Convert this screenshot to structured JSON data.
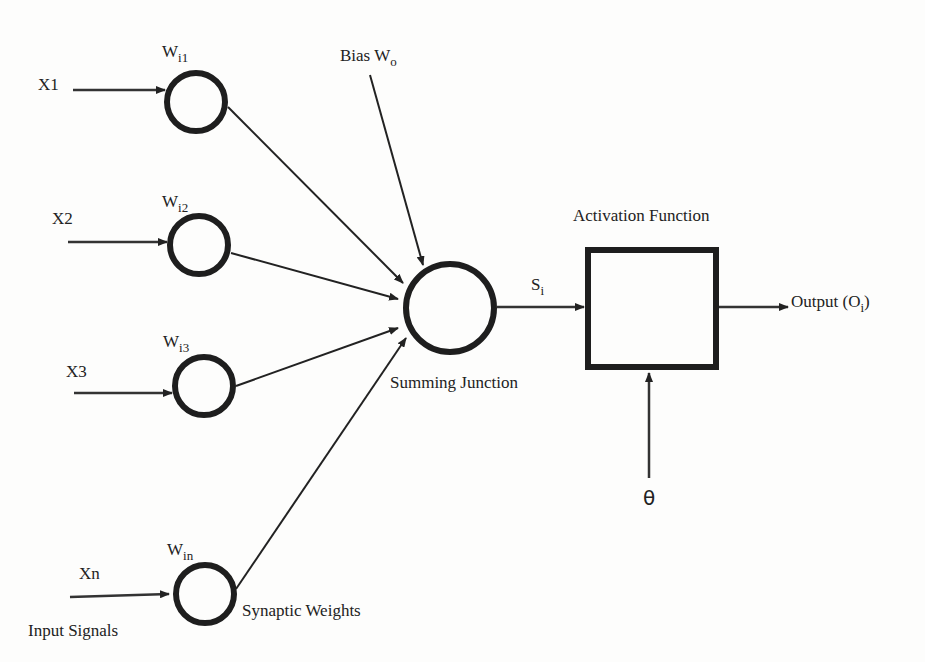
{
  "diagram": {
    "type": "artificial-neuron-model",
    "inputs": [
      {
        "label": "X1",
        "weight_base": "W",
        "weight_sub": "i1"
      },
      {
        "label": "X2",
        "weight_base": "W",
        "weight_sub": "i2"
      },
      {
        "label": "X3",
        "weight_base": "W",
        "weight_sub": "i3"
      },
      {
        "label": "Xn",
        "weight_base": "W",
        "weight_sub": "in"
      }
    ],
    "bias": {
      "base": "Bias W",
      "sub": "o"
    },
    "input_signals_label": "Input Signals",
    "synaptic_weights_label": "Synaptic Weights",
    "summing_junction_label": "Summing Junction",
    "sum_signal": {
      "base": "S",
      "sub": "i"
    },
    "activation_label": "Activation Function",
    "output": {
      "prefix": "Output (O",
      "sub": "i",
      "suffix": ")"
    },
    "threshold_symbol": "θ",
    "colors": {
      "ink": "#222222",
      "background": "#fdfdfc"
    }
  }
}
